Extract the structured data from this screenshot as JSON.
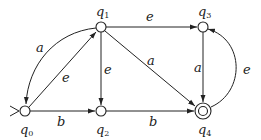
{
  "diagram": {
    "type": "finite-automaton",
    "states": [
      {
        "id": "q0",
        "name": "q",
        "sub": "0",
        "x": 25,
        "y": 111,
        "start": true,
        "accepting": false
      },
      {
        "id": "q1",
        "name": "q",
        "sub": "1",
        "x": 101,
        "y": 27,
        "start": false,
        "accepting": false
      },
      {
        "id": "q2",
        "name": "q",
        "sub": "2",
        "x": 101,
        "y": 111,
        "start": false,
        "accepting": false
      },
      {
        "id": "q3",
        "name": "q",
        "sub": "3",
        "x": 203,
        "y": 27,
        "start": false,
        "accepting": false
      },
      {
        "id": "q4",
        "name": "q",
        "sub": "4",
        "x": 203,
        "y": 111,
        "start": false,
        "accepting": true
      }
    ],
    "transitions": [
      {
        "from": "q1",
        "to": "q0",
        "label": "a",
        "curved": true
      },
      {
        "from": "q0",
        "to": "q1",
        "label": "e"
      },
      {
        "from": "q1",
        "to": "q3",
        "label": "e"
      },
      {
        "from": "q1",
        "to": "q2",
        "label": "e"
      },
      {
        "from": "q1",
        "to": "q4",
        "label": "a"
      },
      {
        "from": "q0",
        "to": "q2",
        "label": "b"
      },
      {
        "from": "q2",
        "to": "q4",
        "label": "b"
      },
      {
        "from": "q3",
        "to": "q4",
        "label": "a"
      },
      {
        "from": "q4",
        "to": "q3",
        "label": "e",
        "curved": true
      }
    ],
    "labels": {
      "q0": "q",
      "q0_sub": "0",
      "q1": "q",
      "q1_sub": "1",
      "q2": "q",
      "q2_sub": "2",
      "q3": "q",
      "q3_sub": "3",
      "q4": "q",
      "q4_sub": "4",
      "e_q1_q0": "a",
      "e_q0_q1": "e",
      "e_q1_q3": "e",
      "e_q1_q2": "e",
      "e_q1_q4": "a",
      "e_q0_q2": "b",
      "e_q2_q4": "b",
      "e_q3_q4": "a",
      "e_q4_q3": "e"
    }
  }
}
